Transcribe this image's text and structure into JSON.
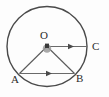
{
  "figure": {
    "background_color": "#fdfdfd",
    "stroke_color": "#4a4a4a",
    "label_color": "#2b2b2b",
    "center_dot_color": "#8a8a8a",
    "center_dot_core_color": "#3a3a3a",
    "labels": {
      "center": "O",
      "right_point": "C",
      "left_point": "A",
      "bottom_right_point": "B"
    },
    "geometry": {
      "circle": {
        "cx": 47,
        "cy": 46.5,
        "r": 40,
        "stroke_width": 1.4
      },
      "center_point": {
        "x": 47,
        "y": 46.5
      },
      "points": {
        "C": {
          "x": 87,
          "y": 46.5
        },
        "A": {
          "x": 19.5,
          "y": 73.5
        },
        "B": {
          "x": 74.5,
          "y": 73.5
        }
      },
      "segments": [
        {
          "name": "radius-OC",
          "from": "O",
          "to": "C",
          "arrow": true,
          "arrow_at": 0.62
        },
        {
          "name": "chord-AB",
          "from": "A",
          "to": "B",
          "arrow": true,
          "arrow_at": 0.55
        },
        {
          "name": "radius-OA",
          "from": "O",
          "to": "A",
          "arrow": false
        },
        {
          "name": "radius-OB",
          "from": "O",
          "to": "B",
          "arrow": false
        }
      ]
    }
  }
}
